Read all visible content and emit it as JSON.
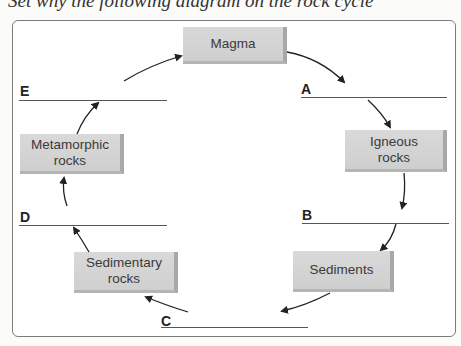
{
  "header": {
    "cut_text": "Set why the following diagram on the rock cycle"
  },
  "diagram": {
    "boxes": {
      "magma": "Magma",
      "igneous": "Igneous rocks",
      "sediments": "Sediments",
      "sedimentary": "Sedimentary rocks",
      "metamorphic": "Metamorphic rocks"
    },
    "blanks": {
      "a": "A",
      "b": "B",
      "c": "C",
      "d": "D",
      "e": "E"
    },
    "colors": {
      "box_fill": "#d4d4d4",
      "line": "#555555",
      "frame": "#7c7c7c"
    }
  }
}
